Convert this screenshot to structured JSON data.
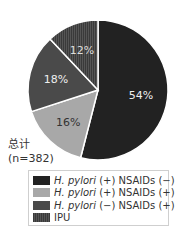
{
  "chart_data": {
    "type": "pie",
    "title": "",
    "total_label": "总计",
    "total_n": "(n=382)",
    "n": 382,
    "categories": [
      "H. pylori (+) NSAIDs (−)",
      "H. pylori (+) NSAIDs (+)",
      "H. pylori (−) NSAIDs (+)",
      "IPU"
    ],
    "values": [
      54,
      16,
      18,
      12
    ],
    "value_labels": [
      "54%",
      "16%",
      "18%",
      "12%"
    ],
    "colors": [
      "#222222",
      "#a8a8a8",
      "#4a4a4a",
      "#3a3a3a"
    ],
    "legend_position": "bottom",
    "start_angle": "12 o'clock, clockwise"
  },
  "legend": {
    "items": [
      {
        "italic": "H. pylori",
        "rest": "(+) NSAIDs (−)",
        "color": "#222222"
      },
      {
        "italic": "H. pylori",
        "rest": "(+) NSAIDs (+)",
        "color": "#a8a8a8"
      },
      {
        "italic": "H. pylori",
        "rest": "(−) NSAIDs (+)",
        "color": "#4a4a4a"
      },
      {
        "italic": "",
        "rest": "IPU",
        "color": "#3a3a3a"
      }
    ]
  },
  "labels": {
    "total": "总计",
    "n": "(n=382)"
  }
}
